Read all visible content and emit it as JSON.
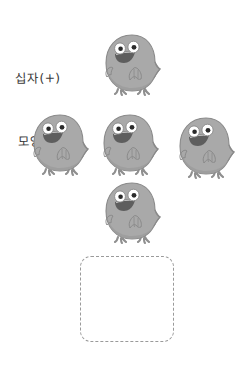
{
  "page": {
    "background_color": "#ffffff",
    "width": 241,
    "height": 370
  },
  "caption": {
    "line1": "십자(+)",
    "line2": "모양이야.",
    "full_text": "십자(+) 모양이야.",
    "ink_color": "#3b3b3b"
  },
  "arrangement": {
    "shape_name": "plus-cross",
    "count": 5,
    "description": "다섯 마리가 십자 모양으로 배치됨"
  },
  "characters": [
    {
      "id": "chick-top",
      "position_label": "top",
      "x": 101,
      "y": 32,
      "width": 62,
      "height": 66,
      "flipped": false,
      "body_color": "#a9a9a9",
      "body_shade": "#9a9a9a",
      "outline_color": "#8a8a8a",
      "eye_white": "#ffffff",
      "pupil_color": "#2b2b2b",
      "mouth_color": "#5e5e5e",
      "foot_color": "#8f8f8f"
    },
    {
      "id": "chick-left",
      "position_label": "left",
      "x": 29,
      "y": 112,
      "width": 62,
      "height": 66,
      "flipped": false,
      "body_color": "#a9a9a9",
      "body_shade": "#9a9a9a",
      "outline_color": "#8a8a8a",
      "eye_white": "#ffffff",
      "pupil_color": "#2b2b2b",
      "mouth_color": "#5e5e5e",
      "foot_color": "#8f8f8f"
    },
    {
      "id": "chick-center",
      "position_label": "center",
      "x": 99,
      "y": 112,
      "width": 62,
      "height": 66,
      "flipped": false,
      "body_color": "#a9a9a9",
      "body_shade": "#9a9a9a",
      "outline_color": "#8a8a8a",
      "eye_white": "#ffffff",
      "pupil_color": "#2b2b2b",
      "mouth_color": "#5e5e5e",
      "foot_color": "#8f8f8f"
    },
    {
      "id": "chick-right",
      "position_label": "right",
      "x": 175,
      "y": 115,
      "width": 62,
      "height": 66,
      "flipped": false,
      "body_color": "#a9a9a9",
      "body_shade": "#9a9a9a",
      "outline_color": "#8a8a8a",
      "eye_white": "#ffffff",
      "pupil_color": "#2b2b2b",
      "mouth_color": "#5e5e5e",
      "foot_color": "#8f8f8f"
    },
    {
      "id": "chick-bottom",
      "position_label": "bottom",
      "x": 101,
      "y": 180,
      "width": 62,
      "height": 66,
      "flipped": false,
      "body_color": "#a9a9a9",
      "body_shade": "#9a9a9a",
      "outline_color": "#8a8a8a",
      "eye_white": "#ffffff",
      "pupil_color": "#2b2b2b",
      "mouth_color": "#5e5e5e",
      "foot_color": "#8f8f8f"
    }
  ],
  "dropbox": {
    "x": 80,
    "y": 256,
    "width": 94,
    "height": 86,
    "border_style": "dashed",
    "border_color": "#9a9a9a",
    "corner_radius": 11,
    "content": ""
  }
}
